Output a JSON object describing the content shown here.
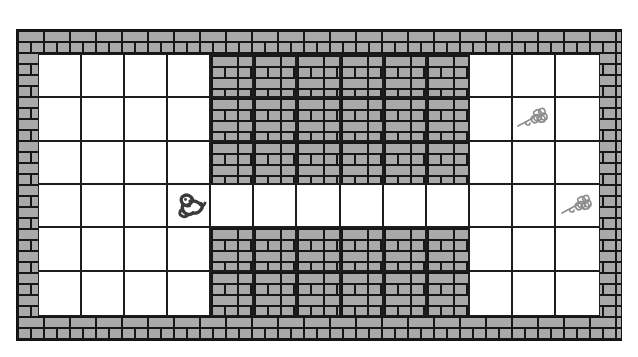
{
  "scene": {
    "title": "Brick maze grid puzzle",
    "background_color": "#ffffff",
    "frame_label": "brick wall border"
  },
  "colors": {
    "brick_fill": "#a9a9a9",
    "mortar": "#171717",
    "grid_line": "#1d1d1d",
    "open_cell": "#ffffff",
    "frog_dark": "#3a3a3a",
    "flower_gray": "#8e8e8e",
    "page_background": "#ffffff"
  },
  "grid": {
    "columns": 13,
    "rows": 6,
    "cell_width_px": 43,
    "cell_height_px": 44,
    "left_px": 38,
    "top_px": 54,
    "width_px": 562,
    "height_px": 262,
    "legend": {
      "open": "open floor tile",
      "wall": "brick wall tile"
    },
    "layout": [
      [
        "open",
        "open",
        "open",
        "open",
        "wall",
        "wall",
        "wall",
        "wall",
        "wall",
        "wall",
        "open",
        "open",
        "open"
      ],
      [
        "open",
        "open",
        "open",
        "open",
        "wall",
        "wall",
        "wall",
        "wall",
        "wall",
        "wall",
        "open",
        "open",
        "open"
      ],
      [
        "open",
        "open",
        "open",
        "open",
        "wall",
        "wall",
        "wall",
        "wall",
        "wall",
        "wall",
        "open",
        "open",
        "open"
      ],
      [
        "open",
        "open",
        "open",
        "open",
        "open",
        "open",
        "open",
        "open",
        "open",
        "open",
        "open",
        "open",
        "open"
      ],
      [
        "open",
        "open",
        "open",
        "open",
        "wall",
        "wall",
        "wall",
        "wall",
        "wall",
        "wall",
        "open",
        "open",
        "open"
      ],
      [
        "open",
        "open",
        "open",
        "open",
        "wall",
        "wall",
        "wall",
        "wall",
        "wall",
        "wall",
        "open",
        "open",
        "open"
      ]
    ]
  },
  "sprites": [
    {
      "id": "frog",
      "name": "frog-sprite",
      "label": "frog",
      "col": 3,
      "row": 3,
      "color": "#3a3a3a"
    },
    {
      "id": "flower-upper",
      "name": "flower-sprite",
      "label": "flower",
      "col": 11,
      "row": 1,
      "color": "#8e8e8e"
    },
    {
      "id": "flower-lower",
      "name": "flower-sprite",
      "label": "flower",
      "col": 12,
      "row": 3,
      "color": "#8e8e8e"
    }
  ],
  "frame": {
    "left_px": 16,
    "top_px": 29,
    "width_px": 606,
    "height_px": 312
  }
}
